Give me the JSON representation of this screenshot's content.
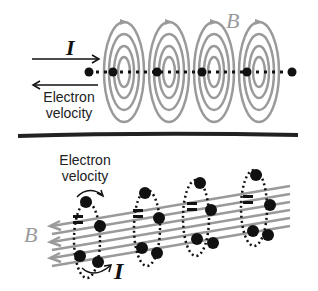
{
  "top_panel": {
    "current_label": "I",
    "field_label": "B",
    "electron_label_line1": "Electron",
    "electron_label_line2": "velocity"
  },
  "bottom_panel": {
    "current_label": "I",
    "field_label": "B",
    "electron_label_line1": "Electron",
    "electron_label_line2": "velocity"
  },
  "colors": {
    "field_lines": "#9a9a9a",
    "electrons": "#111111",
    "text": "#222222"
  }
}
